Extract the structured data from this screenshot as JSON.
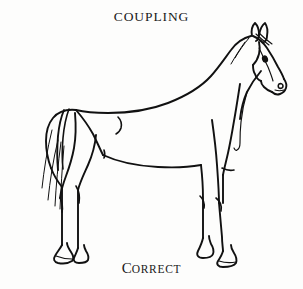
{
  "page": {
    "background_color": "#fdfdfc",
    "ink_color": "#111111",
    "width": 303,
    "height": 289
  },
  "heading": {
    "text": "COUPLING"
  },
  "caption": {
    "initial": "C",
    "rest": "ORRECT",
    "full_text": "CORRECT"
  },
  "figure": {
    "orientation": "facing-right",
    "parts": [
      "ears",
      "forelock",
      "eye",
      "muzzle",
      "nostril",
      "jaw",
      "throat-latch",
      "crest-neck",
      "withers",
      "back",
      "loin-coupling",
      "croup",
      "tail",
      "flank-mark",
      "barrel-belly",
      "chest",
      "shoulder",
      "foreleg-near",
      "foreleg-off",
      "knee",
      "hindleg-near",
      "hindleg-off",
      "hock",
      "stifle",
      "hoof-front",
      "hoof-hind"
    ]
  }
}
